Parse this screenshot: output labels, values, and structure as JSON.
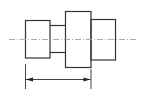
{
  "diagram": {
    "type": "stepped-shaft-technical-drawing",
    "stroke_color": "#333333",
    "centerline_color": "#999999",
    "segments": [
      {
        "name": "left-collar",
        "x": 25,
        "y": 20,
        "w": 25,
        "h": 38
      },
      {
        "name": "neck",
        "x": 50,
        "y": 25,
        "w": 15,
        "h": 27
      },
      {
        "name": "main-body",
        "x": 65,
        "y": 11,
        "w": 26,
        "h": 56
      },
      {
        "name": "right-collar",
        "x": 91,
        "y": 19,
        "w": 25,
        "h": 41
      }
    ],
    "centerline": {
      "x1": 9,
      "x2": 138,
      "y": 39
    },
    "dimension": {
      "x1": 25,
      "x2": 91,
      "y": 79,
      "ext_top": 64,
      "ext_bottom": 89
    }
  }
}
